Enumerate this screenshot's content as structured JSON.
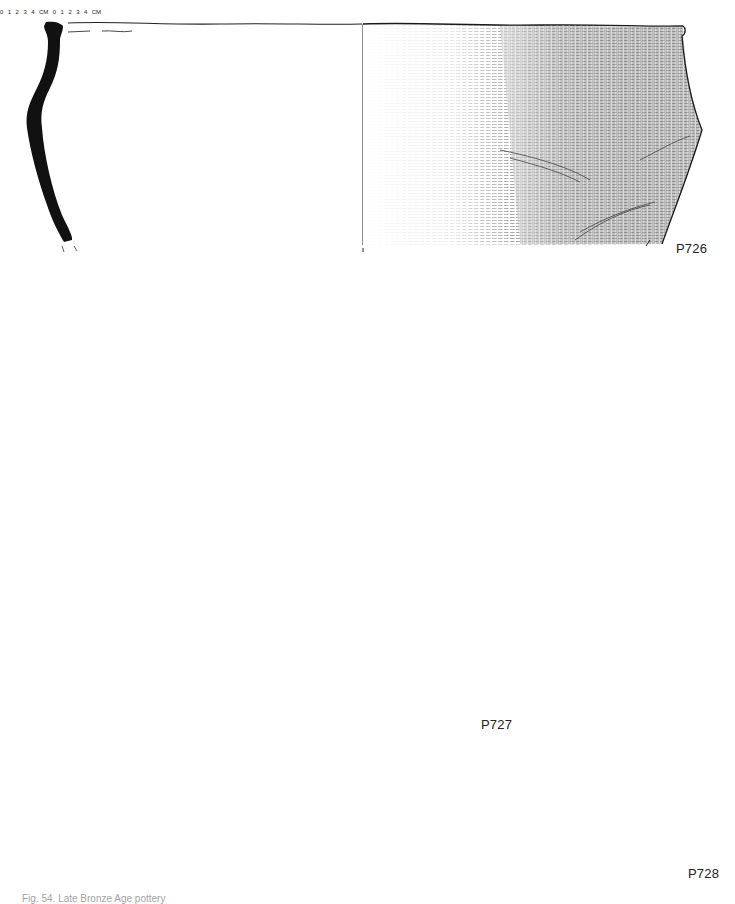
{
  "figure": {
    "caption": "Fig. 54. Late Bronze Age pottery",
    "background": "#ffffff",
    "ink_color": "#111111"
  },
  "vessels": [
    {
      "id": "P726",
      "label": "P726",
      "description": "Carinated jar, rim and upper body; section left, exterior surface stippled right"
    },
    {
      "id": "P727",
      "label": "P727",
      "description": "Conical vessel with flat base; section left, reconstructed exterior sherds with vertical fluting right"
    },
    {
      "id": "P728",
      "label": "P728",
      "description": "Jar rim fragment; section left, exterior sherds right"
    }
  ],
  "scale_bars": [
    {
      "id": "scale-inner",
      "ticks": [
        "0",
        "1",
        "2",
        "3",
        "4"
      ],
      "unit": "CM"
    },
    {
      "id": "scale-outer",
      "ticks": [
        "0",
        "1",
        "2",
        "3",
        "4"
      ],
      "unit": "CM"
    }
  ]
}
